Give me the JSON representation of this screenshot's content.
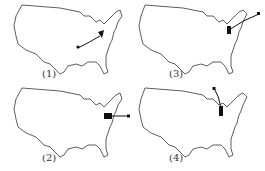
{
  "figure": {
    "panels": [
      {
        "id": 1,
        "label": "(1)",
        "description": "Path from central US (dot) curving northeast to a cluster near the mid-Atlantic"
      },
      {
        "id": 2,
        "label": "(2)",
        "description": "Cluster in mid-Atlantic with short line extending east offshore to a square marker"
      },
      {
        "id": 3,
        "label": "(3)",
        "description": "Cluster in northeast with line extending east-northeast offshore to a square marker"
      },
      {
        "id": 4,
        "label": "(4)",
        "description": "Cluster near Great Lakes/northeast with line extending north into Canada to a square marker"
      }
    ],
    "colors": {
      "outline": "#333333",
      "marker": "#111111",
      "background": "#ffffff"
    }
  }
}
